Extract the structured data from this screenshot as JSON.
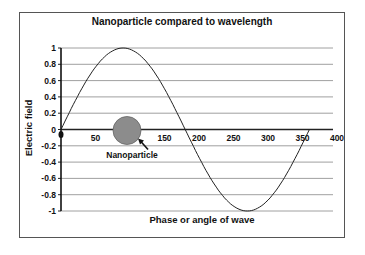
{
  "chart_data": {
    "type": "line",
    "title": "Nanoparticle compared to wavelength",
    "xlabel": "Phase or angle of wave",
    "ylabel": "Electric field",
    "xlim": [
      0,
      400
    ],
    "ylim": [
      -1,
      1
    ],
    "x_ticks": [
      50,
      150,
      200,
      250,
      300,
      350,
      400
    ],
    "y_ticks": [
      1,
      0.8,
      0.6,
      0.4,
      0.2,
      0,
      -0.2,
      -0.4,
      -0.6,
      -0.8,
      -1
    ],
    "grid": true,
    "legend": "none",
    "series": [
      {
        "name": "sin(phase)",
        "x": [
          0,
          30,
          60,
          90,
          120,
          150,
          180,
          210,
          240,
          270,
          300,
          330,
          360
        ],
        "values": [
          0,
          0.5,
          0.87,
          1,
          0.87,
          0.5,
          0,
          -0.5,
          -0.87,
          -1,
          -0.87,
          -0.5,
          0
        ]
      }
    ],
    "annotations": [
      {
        "type": "circle",
        "label": "Nanoparticle",
        "center_x": 100,
        "center_y": 0,
        "color": "#8c8c8c"
      }
    ]
  }
}
